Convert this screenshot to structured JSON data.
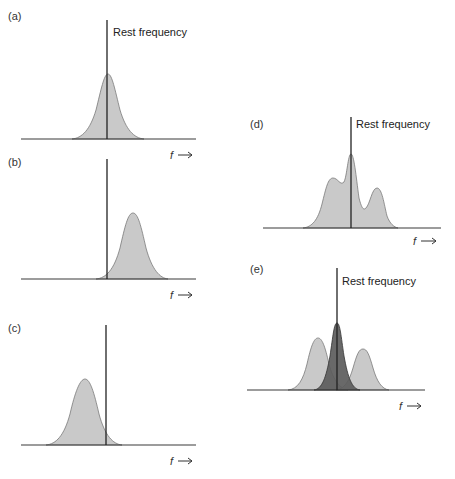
{
  "figure": {
    "rest_label": "Rest frequency",
    "axis_label": "f",
    "colors": {
      "line": "#222222",
      "fill_light": "#c9c9c9",
      "fill_dark": "#5c5c5c",
      "background": "#ffffff"
    },
    "panels": [
      {
        "id": "a",
        "label": "(a)",
        "description": "Symmetric line profile centered on the rest frequency",
        "shows_rest_label": true
      },
      {
        "id": "b",
        "label": "(b)",
        "description": "Line profile shifted to higher frequency (blueshift) relative to rest frequency",
        "shows_rest_label": false
      },
      {
        "id": "c",
        "label": "(c)",
        "description": "Line profile shifted to lower frequency (redshift) relative to rest frequency",
        "shows_rest_label": false
      },
      {
        "id": "d",
        "label": "(d)",
        "description": "Composite multi-peaked profile: central peak at rest frequency with left shoulder and right peak",
        "shows_rest_label": true
      },
      {
        "id": "e",
        "label": "(e)",
        "description": "Decomposition into three components: dark central component at rest frequency, lighter components redshifted and blueshifted",
        "shows_rest_label": true
      }
    ]
  }
}
